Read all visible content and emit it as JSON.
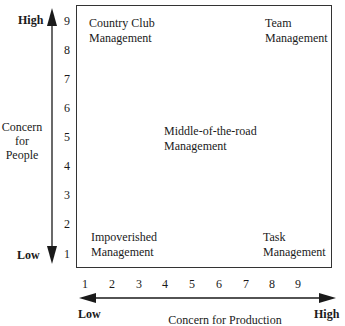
{
  "y_axis": {
    "title_lines": [
      "Concern",
      "for",
      "People"
    ],
    "high_label": "High",
    "low_label": "Low",
    "ticks": [
      "9",
      "8",
      "7",
      "6",
      "5",
      "4",
      "3",
      "2",
      "1"
    ]
  },
  "x_axis": {
    "title": "Concern for Production",
    "high_label": "High",
    "low_label": "Low",
    "ticks": [
      "1",
      "2",
      "3",
      "4",
      "5",
      "6",
      "7",
      "8",
      "9"
    ]
  },
  "quadrants": {
    "country_club": [
      "Country Club",
      "Management"
    ],
    "team": [
      "Team",
      "Management"
    ],
    "middle": [
      "Middle-of-the-road",
      "Management"
    ],
    "impoverished": [
      "Impoverished",
      "Management"
    ],
    "task": [
      "Task",
      "Management"
    ]
  }
}
